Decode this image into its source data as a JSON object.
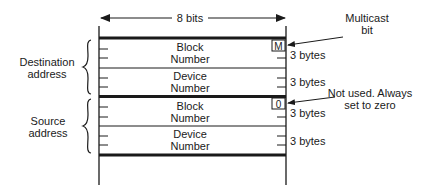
{
  "diagram": {
    "width_label": "8 bits",
    "fields": [
      {
        "line1": "Block",
        "line2": "Number",
        "size": "3 bytes"
      },
      {
        "line1": "Device",
        "line2": "Number",
        "size": "3 bytes"
      },
      {
        "line1": "Block",
        "line2": "Number",
        "size": "3 bytes"
      },
      {
        "line1": "Device",
        "line2": "Number",
        "size": "3 bytes"
      }
    ],
    "groups": [
      {
        "line1": "Destination",
        "line2": "address"
      },
      {
        "line1": "Source",
        "line2": "address"
      }
    ],
    "bit_markers": [
      {
        "glyph": "M"
      },
      {
        "glyph": "0"
      }
    ],
    "annotations": [
      {
        "line1": "Multicast",
        "line2": "bit"
      },
      {
        "line1": "Not used. Always",
        "line2": "set to zero"
      }
    ]
  }
}
